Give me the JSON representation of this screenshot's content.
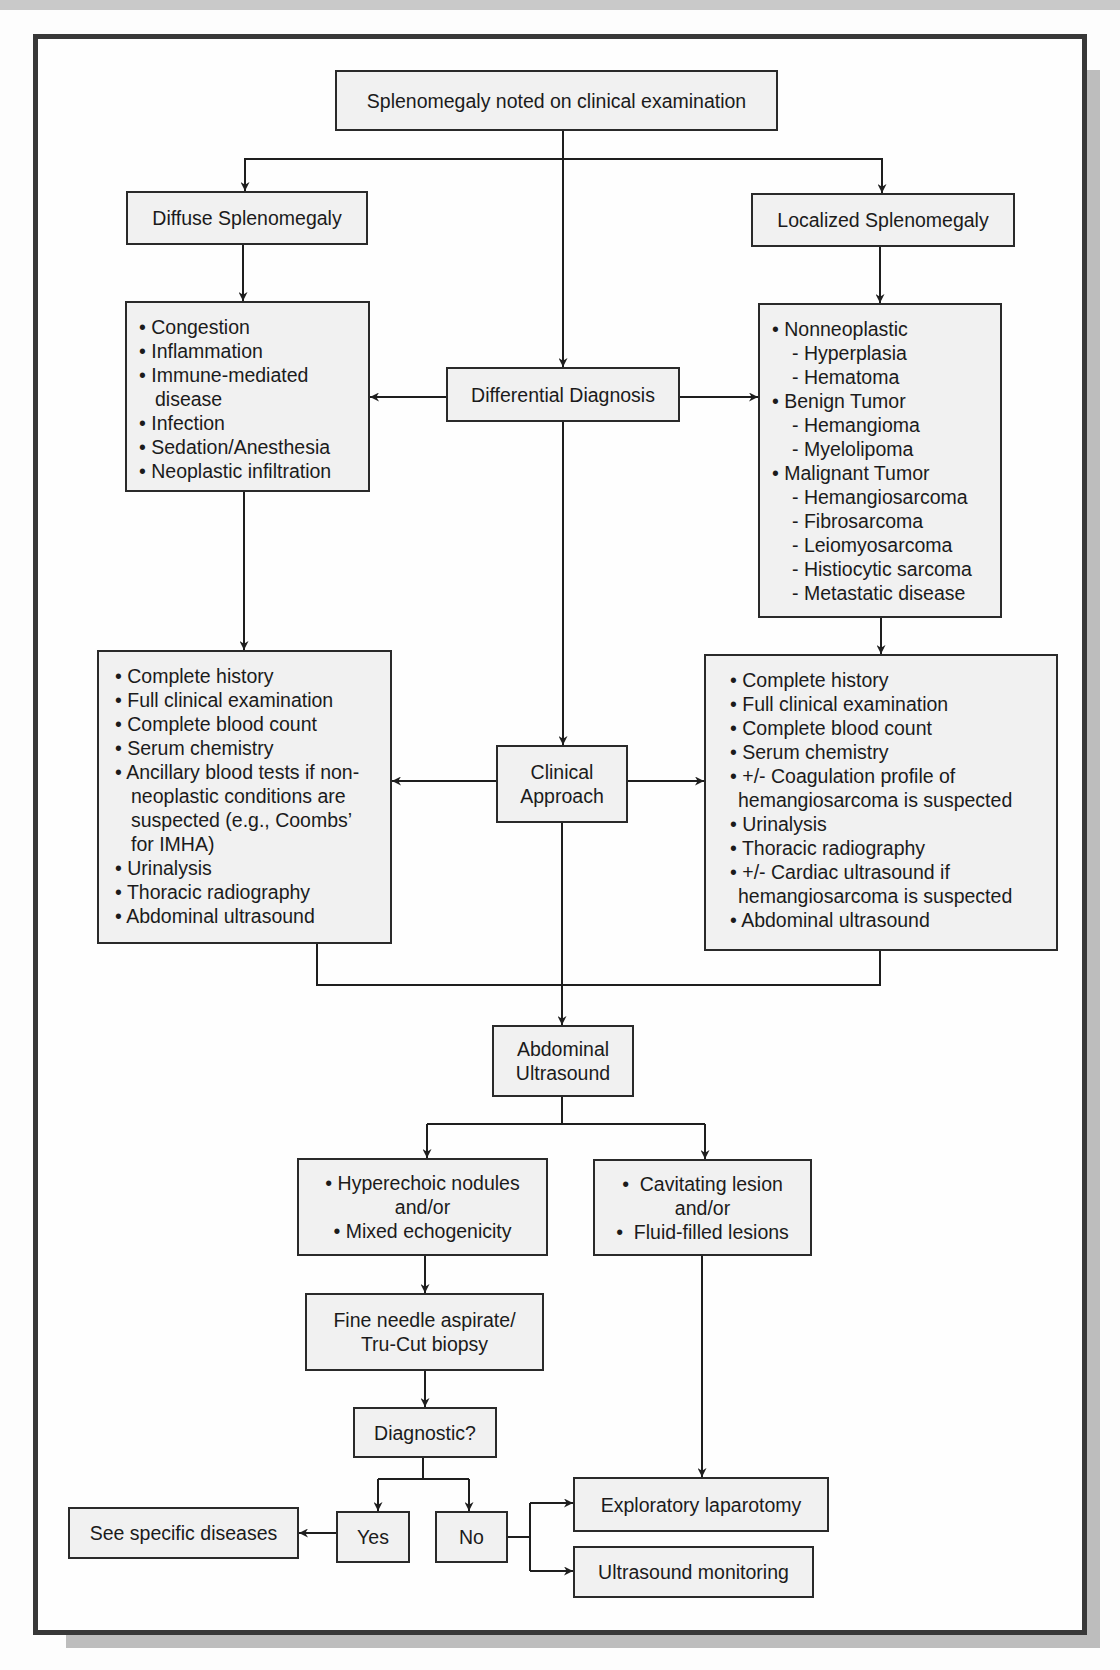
{
  "diagram": {
    "start": "Splenomegaly noted on clinical examination",
    "diffuse": "Diffuse Splenomegaly",
    "localized": "Localized Splenomegaly",
    "differential": "Differential Diagnosis",
    "diffuse_causes": [
      "• Congestion",
      "• Inflammation",
      "• Immune-mediated",
      "disease",
      "• Infection",
      "• Sedation/Anesthesia",
      "• Neoplastic infiltration"
    ],
    "localized_causes": [
      "• Nonneoplastic",
      "- Hyperplasia",
      "- Hematoma",
      "• Benign Tumor",
      "- Hemangioma",
      "- Myelolipoma",
      "• Malignant Tumor",
      "- Hemangiosarcoma",
      "- Fibrosarcoma",
      "- Leiomyosarcoma",
      "- Histiocytic sarcoma",
      "- Metastatic disease"
    ],
    "clinical_approach_line1": "Clinical",
    "clinical_approach_line2": "Approach",
    "diffuse_workup": [
      "• Complete history",
      "• Full clinical examination",
      "• Complete blood count",
      "• Serum chemistry",
      "• Ancillary blood tests if non-",
      "neoplastic conditions are",
      "suspected (e.g., Coombs’",
      "for IMHA)",
      "• Urinalysis",
      "• Thoracic radiography",
      "• Abdominal ultrasound"
    ],
    "localized_workup": [
      "• Complete history",
      "• Full clinical examination",
      "• Complete blood count",
      "• Serum chemistry",
      "• +/- Coagulation profile of",
      "hemangiosarcoma is suspected",
      "• Urinalysis",
      "• Thoracic radiography",
      "• +/- Cardiac ultrasound if",
      "hemangiosarcoma is suspected",
      "• Abdominal ultrasound"
    ],
    "ultrasound_line1": "Abdominal",
    "ultrasound_line2": "Ultrasound",
    "hyperechoic": [
      "• Hyperechoic nodules",
      "and/or",
      "• Mixed echogenicity"
    ],
    "cavitating": [
      "•  Cavitating lesion",
      "and/or",
      "•  Fluid-filled lesions"
    ],
    "fna_line1": "Fine needle aspirate/",
    "fna_line2": "Tru-Cut biopsy",
    "diagnostic": "Diagnostic?",
    "yes": "Yes",
    "no": "No",
    "see_specific": "See specific diseases",
    "exploratory": "Exploratory laparotomy",
    "monitoring": "Ultrasound monitoring"
  }
}
